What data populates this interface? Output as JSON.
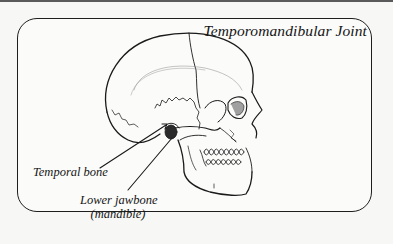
{
  "diagram": {
    "title": "Temporomandibular Joint",
    "labels": {
      "temporal_bone": "Temporal bone",
      "lower_jawbone_line1": "Lower jawbone",
      "lower_jawbone_line2": "(mandible)"
    },
    "illustration": "skull-side-view",
    "colors": {
      "background": "#f7f7f5",
      "frame": "#1e1e1e",
      "ink": "#151515"
    }
  }
}
